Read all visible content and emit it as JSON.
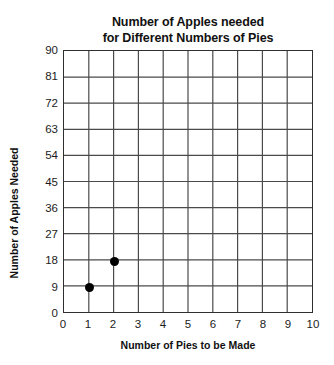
{
  "chart_data": {
    "type": "scatter",
    "title": "Number of Apples needed for Different Numbers of Pies",
    "title_lines": [
      "Number of Apples needed",
      "for Different Numbers of Pies"
    ],
    "xlabel": "Number of Pies to be Made",
    "ylabel": "Number of Apples Needed",
    "xlim": [
      0,
      10
    ],
    "ylim": [
      0,
      90
    ],
    "xticks": [
      0,
      1,
      2,
      3,
      4,
      5,
      6,
      7,
      8,
      9,
      10
    ],
    "yticks": [
      0,
      9,
      18,
      27,
      36,
      45,
      54,
      63,
      72,
      81,
      90
    ],
    "xtick_labels": [
      "0",
      "1",
      "2",
      "3",
      "4",
      "5",
      "6",
      "7",
      "8",
      "9",
      "10"
    ],
    "ytick_labels": [
      "0",
      "9",
      "18",
      "27",
      "36",
      "45",
      "54",
      "63",
      "72",
      "81",
      "90"
    ],
    "x": [
      1,
      2
    ],
    "y": [
      9,
      18
    ],
    "points": [
      {
        "label": "point-1-9",
        "x": 1,
        "y": 9
      },
      {
        "label": "point-2-18",
        "x": 2,
        "y": 18
      }
    ],
    "grid": true,
    "legend": null,
    "marker_color": "#000000",
    "grid_color": "#4a4a4a",
    "axis_color": "#2f2f2f",
    "background": "#ffffff"
  }
}
